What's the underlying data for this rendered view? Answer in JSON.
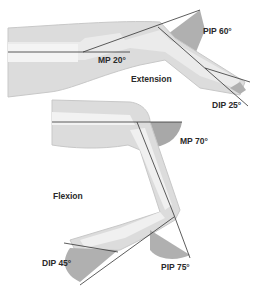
{
  "diagram": {
    "sections": {
      "extension": {
        "label": "Extension",
        "angles": [
          {
            "joint": "MP",
            "label": "MP 20°"
          },
          {
            "joint": "PIP",
            "label": "PIP 60°"
          },
          {
            "joint": "DIP",
            "label": "DIP 25°"
          }
        ]
      },
      "flexion": {
        "label": "Flexion",
        "angles": [
          {
            "joint": "MP",
            "label": "MP 70°"
          },
          {
            "joint": "PIP",
            "label": "PIP 75°"
          },
          {
            "joint": "DIP",
            "label": "DIP 45°"
          }
        ]
      }
    },
    "colors": {
      "skin": "#dcdcdc",
      "bone": "#f0f0f0",
      "shade": "#a8a8a8",
      "line": "#333333"
    }
  }
}
